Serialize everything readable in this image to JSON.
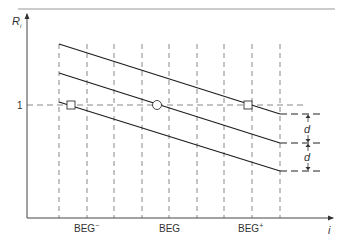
{
  "diagram": {
    "y_axis": {
      "label": "R",
      "label_subscript": "i",
      "tick_label": "1"
    },
    "x_axis": {
      "label": "i",
      "tick_labels": [
        {
          "text": "BEG",
          "superscript": "−"
        },
        {
          "text": "BEG",
          "superscript": ""
        },
        {
          "text": "BEG",
          "superscript": "+"
        }
      ]
    },
    "dimension_label": "d",
    "series": [
      {
        "name": "upper-line"
      },
      {
        "name": "middle-line"
      },
      {
        "name": "lower-line"
      }
    ],
    "markers": [
      {
        "name": "beg-minus-marker",
        "shape": "square"
      },
      {
        "name": "beg-marker",
        "shape": "circle"
      },
      {
        "name": "beg-plus-marker",
        "shape": "square"
      }
    ]
  }
}
